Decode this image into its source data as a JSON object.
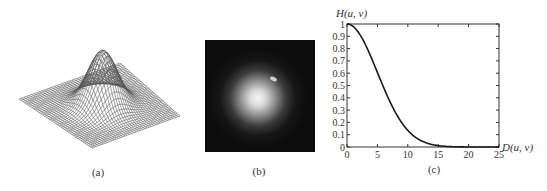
{
  "figure": {
    "panels": [
      {
        "id": "a",
        "caption": "(a)",
        "description": "3D mesh plot of Gaussian lowpass filter transfer function"
      },
      {
        "id": "b",
        "caption": "(b)",
        "description": "Filter displayed as an image"
      },
      {
        "id": "c",
        "caption": "(c)",
        "description": "Filter radial cross section"
      }
    ]
  },
  "chart_data": [
    {
      "type": "surface",
      "panel": "a",
      "title": "",
      "caption": "(a)",
      "function": "Gaussian lowpass H(u,v)=exp(-D^2/(2*D0^2))"
    },
    {
      "type": "heatmap",
      "panel": "b",
      "caption": "(b)",
      "background": "#0c0c0c",
      "center_color": "#f4f4f4"
    },
    {
      "type": "line",
      "panel": "c",
      "caption": "(c)",
      "title": "",
      "xlabel": "D(u, v)",
      "ylabel": "H(u, v)",
      "xlim": [
        0,
        25
      ],
      "ylim": [
        0,
        1
      ],
      "xticks": [
        0,
        5,
        10,
        15,
        20,
        25
      ],
      "yticks": [
        0,
        0.1,
        0.2,
        0.3,
        0.4,
        0.5,
        0.6,
        0.7,
        0.8,
        0.9,
        1
      ],
      "xtick_labels": [
        "0",
        "5",
        "10",
        "15",
        "20",
        "25"
      ],
      "ytick_labels": [
        "0",
        "0.1",
        "0.2",
        "0.3",
        "0.4",
        "0.5",
        "0.6",
        "0.7",
        "0.8",
        "0.9",
        "1"
      ],
      "grid": false,
      "series": [
        {
          "name": "H(u,v)",
          "color": "#1a1a1a",
          "x": [
            0,
            1,
            2,
            3,
            4,
            5,
            6,
            7,
            8,
            9,
            10,
            11,
            12,
            13,
            14,
            15,
            16,
            17,
            18,
            19,
            20,
            21,
            22,
            23,
            24,
            25
          ],
          "y": [
            1.0,
            0.98,
            0.923,
            0.835,
            0.726,
            0.607,
            0.487,
            0.375,
            0.278,
            0.198,
            0.135,
            0.089,
            0.056,
            0.034,
            0.02,
            0.011,
            0.006,
            0.003,
            0.002,
            0.001,
            0.0,
            0.0,
            0.0,
            0.0,
            0.0,
            0.0
          ]
        }
      ]
    }
  ]
}
